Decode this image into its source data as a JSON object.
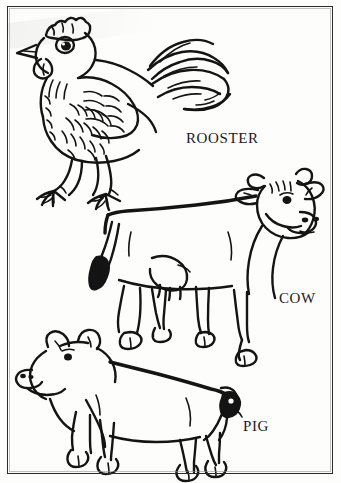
{
  "page": {
    "width": 341,
    "height": 483,
    "background_color": "#fdfdfc",
    "ink_color": "#141414",
    "border_color": "#2b2b2b",
    "style": "black and white line art"
  },
  "frame": {
    "name": "page-border",
    "visible": true
  },
  "illustrations": [
    {
      "id": "rooster",
      "label": "ROOSTER",
      "label_x": 186,
      "label_y": 131,
      "position": "top",
      "facing": "left"
    },
    {
      "id": "cow",
      "label": "COW",
      "label_x": 279,
      "label_y": 291,
      "position": "middle",
      "facing": "right"
    },
    {
      "id": "pig",
      "label": "PIG",
      "label_x": 243,
      "label_y": 419,
      "position": "bottom",
      "facing": "left"
    }
  ],
  "labels": {
    "rooster": "ROOSTER",
    "cow": "COW",
    "pig": "PIG"
  }
}
